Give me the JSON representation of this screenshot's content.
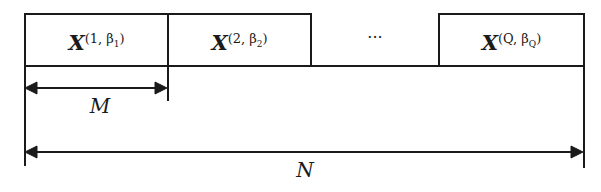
{
  "diagram": {
    "blocks": [
      {
        "symbol": "X",
        "sup_a": "1",
        "sup_b": "β",
        "sup_sub": "1"
      },
      {
        "symbol": "X",
        "sup_a": "2",
        "sup_b": "β",
        "sup_sub": "2"
      },
      {
        "ellipsis": "···"
      },
      {
        "symbol": "X",
        "sup_a": "Q",
        "sup_b": "β",
        "sup_sub": "Q"
      }
    ],
    "dimensions": {
      "block_length": "M",
      "total_length": "N"
    },
    "line_color": "#1a1a1a"
  }
}
